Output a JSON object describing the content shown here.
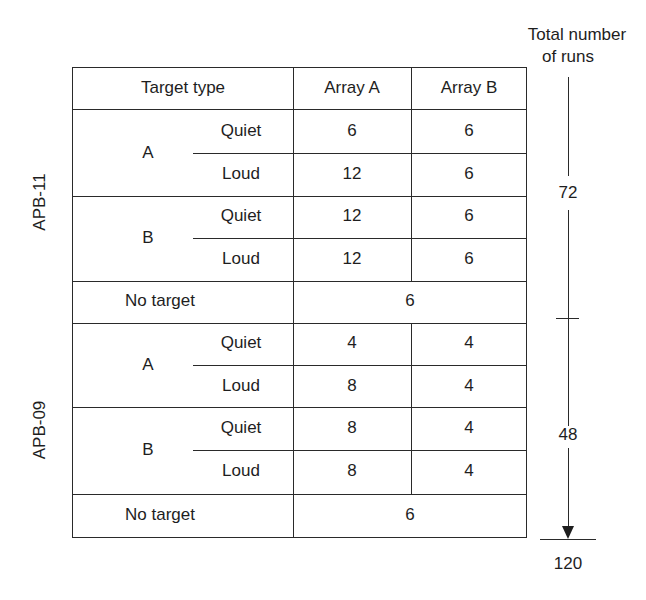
{
  "header": {
    "target_type": "Target type",
    "array_a": "Array A",
    "array_b": "Array B"
  },
  "annotation": {
    "title_line1": "Total number",
    "title_line2": "of runs",
    "segment1_total": "72",
    "segment2_total": "48",
    "grand_total": "120"
  },
  "groups": [
    {
      "label": "APB-11",
      "targets": [
        {
          "type": "A",
          "rows": [
            {
              "condition": "Quiet",
              "array_a": "6",
              "array_b": "6"
            },
            {
              "condition": "Loud",
              "array_a": "12",
              "array_b": "6"
            }
          ]
        },
        {
          "type": "B",
          "rows": [
            {
              "condition": "Quiet",
              "array_a": "12",
              "array_b": "6"
            },
            {
              "condition": "Loud",
              "array_a": "12",
              "array_b": "6"
            }
          ]
        }
      ],
      "no_target": {
        "label": "No target",
        "value": "6"
      }
    },
    {
      "label": "APB-09",
      "targets": [
        {
          "type": "A",
          "rows": [
            {
              "condition": "Quiet",
              "array_a": "4",
              "array_b": "4"
            },
            {
              "condition": "Loud",
              "array_a": "8",
              "array_b": "4"
            }
          ]
        },
        {
          "type": "B",
          "rows": [
            {
              "condition": "Quiet",
              "array_a": "8",
              "array_b": "4"
            },
            {
              "condition": "Loud",
              "array_a": "8",
              "array_b": "4"
            }
          ]
        }
      ],
      "no_target": {
        "label": "No target",
        "value": "6"
      }
    }
  ]
}
